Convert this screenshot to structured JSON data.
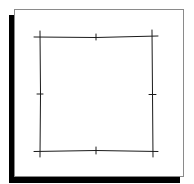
{
  "figure": {
    "colors": {
      "background": "#ffffff",
      "card": "#ffffff",
      "card_border": "#8a8a8a",
      "shadow": "#000000",
      "stroke": "#1a1a1a"
    },
    "square": {
      "top_left": [
        40,
        37
      ],
      "top_right": [
        152,
        36
      ],
      "bottom_right": [
        153,
        152
      ],
      "bottom_left": [
        40,
        151
      ]
    },
    "ticks": [
      {
        "name": "top-mid",
        "at": [
          96,
          37
        ],
        "orientation": "vertical"
      },
      {
        "name": "bottom-mid",
        "at": [
          96,
          151
        ],
        "orientation": "vertical"
      },
      {
        "name": "left-mid",
        "at": [
          40,
          94
        ],
        "orientation": "horizontal"
      },
      {
        "name": "right-mid",
        "at": [
          152,
          94
        ],
        "orientation": "horizontal"
      }
    ]
  }
}
